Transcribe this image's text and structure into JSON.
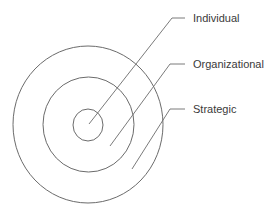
{
  "diagram": {
    "type": "concentric-circles",
    "stroke_color": "#6b6b6b",
    "text_color": "#3a3a3a",
    "rings": [
      {
        "name": "inner",
        "cx": 88,
        "cy": 125,
        "rx": 15,
        "ry": 16
      },
      {
        "name": "middle",
        "cx": 88.5,
        "cy": 124.5,
        "rx": 45.5,
        "ry": 47.5
      },
      {
        "name": "outer",
        "cx": 88,
        "cy": 124.5,
        "rx": 75,
        "ry": 78.5
      }
    ],
    "labels": [
      {
        "text": "Individual",
        "x": 193,
        "y": 12,
        "leader": "89,124 172,18 185,18"
      },
      {
        "text": "Organizational",
        "x": 193,
        "y": 58,
        "leader": "110,146 170,64 185,64"
      },
      {
        "text": "Strategic",
        "x": 193,
        "y": 103,
        "leader": "132,169 170,109 185,109"
      }
    ]
  }
}
